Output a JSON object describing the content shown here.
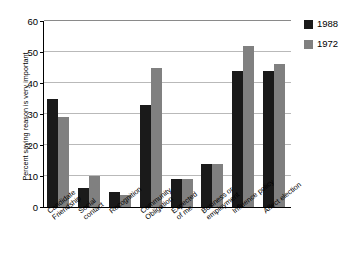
{
  "chart_data": {
    "type": "bar",
    "title": "",
    "xlabel": "",
    "ylabel": "Percent saying reason is very important",
    "ylim": [
      0,
      60
    ],
    "yticks": [
      0,
      10,
      20,
      30,
      40,
      50,
      60
    ],
    "grid": true,
    "legend_position": "right",
    "categories": [
      "Candidate\nFriendship",
      "Social\ncontact",
      "Recognition",
      "Community\nObligation",
      "Expected\nof me",
      "Business or\nemployment",
      "Influence policy",
      "Affect election"
    ],
    "series": [
      {
        "name": "1988",
        "color": "#1a1a1a",
        "values": [
          35,
          6,
          5,
          33,
          9,
          14,
          44,
          44
        ]
      },
      {
        "name": "1972",
        "color": "#808080",
        "values": [
          29,
          10,
          4,
          45,
          9,
          14,
          52,
          46
        ]
      }
    ]
  },
  "legend": {
    "items": [
      {
        "label": "1988",
        "color": "#1a1a1a"
      },
      {
        "label": "1972",
        "color": "#808080"
      }
    ]
  },
  "axis": {
    "y_title": "Percent saying reason is very important",
    "y_tick_labels": [
      "60",
      "50",
      "40",
      "30",
      "20",
      "10",
      "0"
    ]
  }
}
